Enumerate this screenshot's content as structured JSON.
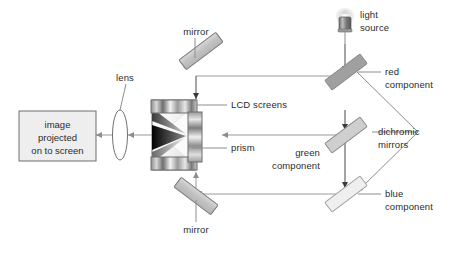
{
  "diagram": {
    "background_color": "#ffffff",
    "line_color": "#8d8d8d",
    "text_color": "#2b2b2b"
  },
  "labels": {
    "mirror_top": "mirror",
    "mirror_bottom": "mirror",
    "lens": "lens",
    "lcd_screens": "LCD screens",
    "prism": "prism",
    "light_source": "light\nsource",
    "red_component": "red\ncomponent",
    "green_component": "green\ncomponent",
    "blue_component": "blue\ncomponent",
    "dichromic_mirrors": "dichromic\nmirrors"
  },
  "screen": {
    "text": "image\nprojected\non to screen",
    "fill": "#eeeeee",
    "border": "#6e6e6e"
  },
  "components": {
    "mirror_fill": "#c9c9c9",
    "mirror_stroke": "#7a7a7a",
    "dichromic_red_fill": "#a0a0a0",
    "dichromic_green_fill": "#cfcfcf",
    "dichromic_blue_fill": "#efefef",
    "dichromic_stroke": "#8a8a8a",
    "prism_dark": "#111111",
    "prism_light": "#f2f2f2",
    "lens_stroke": "#707070",
    "lamp_body": "#8a8a8a"
  },
  "icons": {
    "light_source": "lamp-icon",
    "lens": "lens-icon",
    "prism": "prism-icon",
    "mirror": "mirror-icon",
    "dichromic_mirror": "dichromic-mirror-icon",
    "screen": "projection-screen-icon",
    "arrow": "arrow-icon"
  }
}
